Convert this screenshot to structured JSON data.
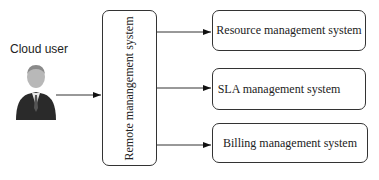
{
  "diagram": {
    "user": {
      "label": "Cloud user",
      "icon": "businessman-avatar-icon"
    },
    "central": {
      "label": "Remote manangement system"
    },
    "targets": [
      {
        "label": "Resource management system"
      },
      {
        "label": "SLA management system"
      },
      {
        "label": "Billing management system"
      }
    ],
    "colors": {
      "stroke": "#333333",
      "background": "#ffffff"
    }
  }
}
